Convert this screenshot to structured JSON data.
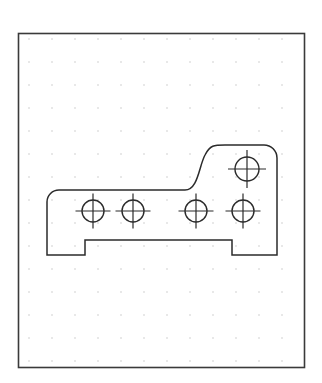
{
  "document": {
    "title": "Technical Drawing Sketch",
    "background_color": "#ffffff"
  },
  "canvas": {
    "width": 322,
    "height": 383,
    "border": {
      "x": 18,
      "y": 33,
      "width": 286,
      "height": 334,
      "stroke_color": "#3a3a3a",
      "stroke_width": 1.6,
      "fill": "none"
    },
    "grid": {
      "visible": true,
      "style": "dots",
      "origin_x": 29,
      "origin_y": 39,
      "spacing_x": 23,
      "spacing_y": 23,
      "columns": 12,
      "rows": 15,
      "dot_size": 1.1,
      "dot_color": "#b4b4b4"
    }
  },
  "drawing": {
    "name": "bracket-profile",
    "stroke_color": "#2b2b2b",
    "stroke_width": 1.5,
    "fill": "none",
    "outline_path": "M 47 205 L 47 255 L 85 255 L 85 240 L 232 240 L 232 255 L 277 255 L 277 158 A 13 13 0 0 0 264 145 L 225 145 C 214 145 210 145 205 155 C 199 166 198 190 185 190 L 59 190 A 12 12 0 0 0 47 202 Z",
    "description": "Closed profile of an L-shaped mounting bracket with rounded top-left corner, rounded top-right corner, an S-curve step on the upper edge, and a rectangular notch along the lower edge.",
    "holes": [
      {
        "id": "hole-1",
        "cx": 93,
        "cy": 211,
        "r": 11,
        "tick_extent": 6.5
      },
      {
        "id": "hole-2",
        "cx": 133,
        "cy": 211,
        "r": 11,
        "tick_extent": 6.5
      },
      {
        "id": "hole-3",
        "cx": 196,
        "cy": 211,
        "r": 11,
        "tick_extent": 6.5
      },
      {
        "id": "hole-4",
        "cx": 243,
        "cy": 211,
        "r": 11,
        "tick_extent": 6.5
      },
      {
        "id": "hole-5",
        "cx": 247,
        "cy": 169,
        "r": 12,
        "tick_extent": 7.0
      }
    ],
    "hole_count": 5,
    "hole_stroke_color": "#2b2b2b",
    "hole_stroke_width": 1.4,
    "centermark_stroke_width": 1.2
  }
}
